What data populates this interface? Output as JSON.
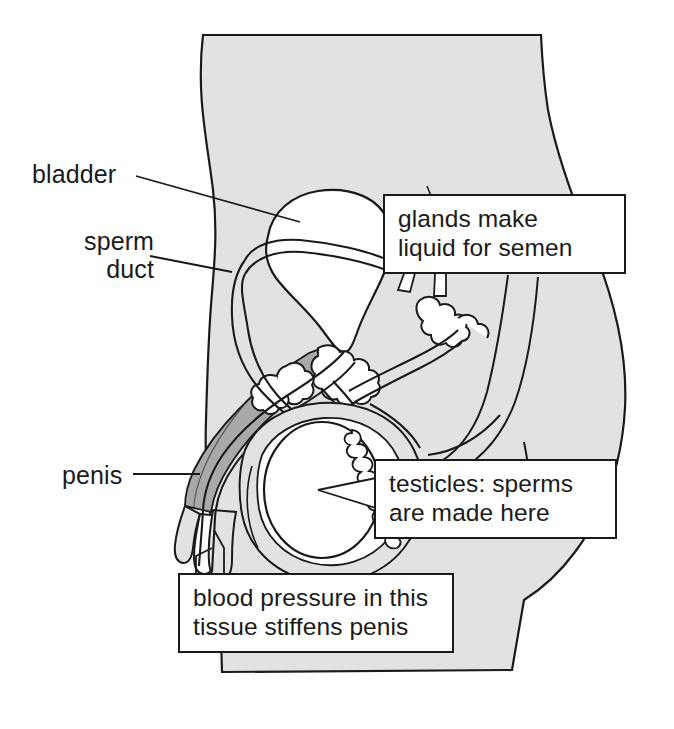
{
  "diagram": {
    "colors": {
      "background": "#ffffff",
      "body_fill": "#e2e2e2",
      "body_outline": "#1a1a1a",
      "organ_fill": "#ffffff",
      "erectile_tissue_fill": "#a9a9a9",
      "text": "#1a1a1a",
      "callout_border": "#1a1a1a",
      "callout_fill": "#ffffff"
    },
    "labels": [
      {
        "id": "bladder",
        "text": "bladder",
        "kind": "leader-line"
      },
      {
        "id": "sperm_duct",
        "text": "sperm\nduct",
        "kind": "leader-line"
      },
      {
        "id": "penis",
        "text": "penis",
        "kind": "leader-line"
      }
    ],
    "callouts": [
      {
        "id": "glands",
        "text": "glands make\nliquid for semen",
        "kind": "box"
      },
      {
        "id": "testicles",
        "text": "testicles: sperms\nare made here",
        "kind": "box-arrow"
      },
      {
        "id": "tissue",
        "text": "blood pressure in this\ntissue stiffens penis",
        "kind": "box"
      }
    ],
    "structures": [
      "body-silhouette",
      "bladder",
      "sperm-duct",
      "urethra",
      "prostate-gland",
      "seminal-vesicle-gland",
      "bulbourethral-gland",
      "erectile-tissue",
      "penis-shaft",
      "scrotum",
      "testicle",
      "epididymis",
      "buttock-contour"
    ]
  }
}
